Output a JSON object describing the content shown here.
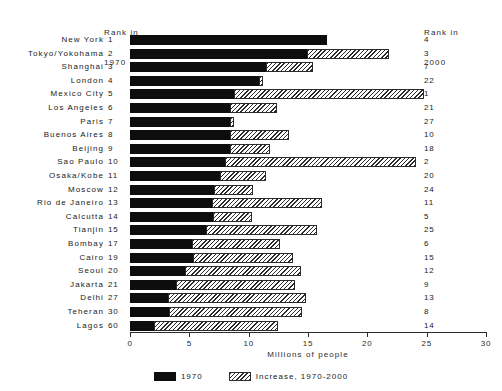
{
  "headers": {
    "left_line1": "Rank in",
    "left_line2": "1970",
    "right_line1": "Rank in",
    "right_line2": "2000"
  },
  "legend": {
    "items": [
      {
        "label": "1970",
        "pattern": "solid",
        "color": "#0d0d0d"
      },
      {
        "label": "Increase, 1970-2000",
        "pattern": "hatch",
        "color": "#2b2b2b"
      }
    ]
  },
  "chart_data": {
    "type": "bar",
    "orientation": "horizontal",
    "stacked": true,
    "title": "",
    "xlabel": "Millions of people",
    "ylabel": "",
    "xlim": [
      0,
      30
    ],
    "xticks": [
      0,
      5,
      10,
      15,
      20,
      25,
      30
    ],
    "xtick_labels": [
      "0",
      "5",
      "10",
      "15",
      "20",
      "25",
      "30"
    ],
    "grid": false,
    "legend_position": "bottom",
    "categories": [
      "New York",
      "Tokyo/Yokohama",
      "Shanghai",
      "London",
      "Mexico City",
      "Los Angeles",
      "Paris",
      "Buenos Aires",
      "Beijing",
      "Sao Paulo",
      "Osaka/Kobe",
      "Moscow",
      "Rio de Janeiro",
      "Calcutta",
      "Tianjin",
      "Bombay",
      "Cairo",
      "Seoul",
      "Jakarta",
      "Delhi",
      "Teheran",
      "Lagos"
    ],
    "rank_1970": [
      1,
      2,
      3,
      4,
      5,
      6,
      7,
      8,
      9,
      10,
      11,
      12,
      13,
      14,
      15,
      17,
      19,
      20,
      21,
      27,
      30,
      60
    ],
    "rank_2000": [
      4,
      3,
      7,
      22,
      1,
      21,
      27,
      10,
      18,
      2,
      20,
      24,
      11,
      5,
      25,
      6,
      15,
      12,
      9,
      13,
      8,
      14
    ],
    "series": [
      {
        "name": "1970",
        "values": [
          16.6,
          14.9,
          11.5,
          10.9,
          8.8,
          8.4,
          8.4,
          8.4,
          8.4,
          8.0,
          7.6,
          7.1,
          6.9,
          7.0,
          6.4,
          5.2,
          5.3,
          4.6,
          3.9,
          3.2,
          3.3,
          2.0
        ]
      },
      {
        "name": "Increase, 1970-2000",
        "values": [
          0.0,
          6.9,
          3.9,
          0.3,
          16.0,
          4.0,
          0.4,
          5.0,
          3.4,
          16.1,
          3.9,
          3.3,
          9.3,
          3.3,
          9.4,
          7.4,
          8.4,
          9.8,
          10.0,
          11.6,
          11.2,
          10.5
        ]
      }
    ],
    "totals": [
      16.6,
      21.8,
      15.4,
      11.2,
      24.8,
      12.4,
      8.8,
      13.4,
      11.8,
      24.1,
      11.5,
      10.4,
      16.2,
      10.3,
      15.8,
      12.6,
      13.7,
      14.4,
      13.9,
      14.8,
      14.5,
      12.5
    ]
  }
}
